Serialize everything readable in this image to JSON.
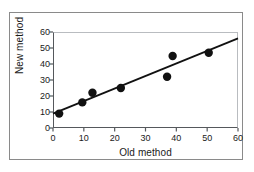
{
  "chart_data": {
    "type": "scatter",
    "title": "",
    "xlabel": "Old method",
    "ylabel": "New method",
    "xlim": [
      0,
      60
    ],
    "ylim": [
      0,
      60
    ],
    "xticks": [
      0,
      10,
      20,
      30,
      40,
      50,
      60
    ],
    "yticks": [
      0,
      10,
      20,
      30,
      40,
      50,
      60
    ],
    "xtick_labels": [
      "0",
      "10",
      "20",
      "30",
      "40",
      "50",
      "60"
    ],
    "ytick_labels": [
      "0",
      "10",
      "20",
      "30",
      "40",
      "50",
      "60"
    ],
    "grid": false,
    "legend": null,
    "marker_color": "#111111",
    "line_color": "#111111",
    "axis_color": "#55585c",
    "frame_color": "#8a8a8a",
    "background": "#ffffff",
    "points": [
      {
        "x": 2.0,
        "y": 9.0
      },
      {
        "x": 9.5,
        "y": 16.0
      },
      {
        "x": 12.8,
        "y": 22.0
      },
      {
        "x": 22.0,
        "y": 25.0
      },
      {
        "x": 37.0,
        "y": 32.0
      },
      {
        "x": 38.8,
        "y": 45.0
      },
      {
        "x": 50.5,
        "y": 47.0
      }
    ],
    "fit_line": {
      "label": "regression line",
      "x0": 0.0,
      "y0": 9.0,
      "x1": 60.0,
      "y1": 56.0
    }
  }
}
